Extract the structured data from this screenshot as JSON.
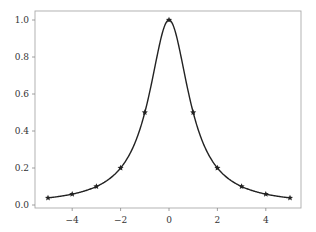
{
  "chart_data": {
    "type": "line",
    "title": "",
    "xlabel": "",
    "ylabel": "",
    "x": [
      -5,
      -4,
      -3,
      -2,
      -1,
      0,
      1,
      2,
      3,
      4,
      5
    ],
    "series": [
      {
        "name": "1/(1+x^2)",
        "values": [
          0.0385,
          0.0588,
          0.1,
          0.2,
          0.5,
          1.0,
          0.5,
          0.2,
          0.1,
          0.0588,
          0.0385
        ],
        "marker": "star",
        "color": "#222222",
        "smooth": true
      }
    ],
    "xlim": [
      -5.5,
      5.5
    ],
    "ylim": [
      -0.01,
      1.05
    ],
    "xticks": [
      -4,
      -2,
      0,
      2,
      4
    ],
    "xtick_labels": [
      "−4",
      "−2",
      "0",
      "2",
      "4"
    ],
    "yticks": [
      0.0,
      0.2,
      0.4,
      0.6,
      0.8,
      1.0
    ],
    "ytick_labels": [
      "0.0",
      "0.2",
      "0.4",
      "0.6",
      "0.8",
      "1.0"
    ],
    "grid": false,
    "legend": null
  }
}
